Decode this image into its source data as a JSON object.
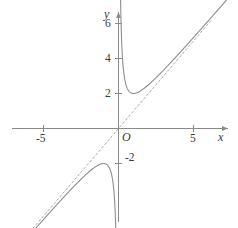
{
  "figure": {
    "width": 238,
    "height": 228,
    "background": "#ffffff",
    "stroke_color": "#8a8a8a",
    "label_color": "#3a3a3a",
    "asymptote_color": "#a8a8a8"
  },
  "axes": {
    "x_label": "x",
    "y_label": "y",
    "origin_label": "O"
  },
  "ticks": {
    "x": [
      {
        "value": -5,
        "label": "-5"
      },
      {
        "value": 5,
        "label": "5"
      }
    ],
    "y": [
      {
        "value": -2,
        "label": "-2"
      },
      {
        "value": 2,
        "label": "2"
      },
      {
        "value": 4,
        "label": "4"
      },
      {
        "value": 6,
        "label": "6"
      }
    ]
  },
  "chart_data": {
    "type": "line",
    "title": "",
    "xlabel": "x",
    "ylabel": "y",
    "xlim": [
      -6.8,
      6.8
    ],
    "ylim": [
      -5.8,
      7.3
    ],
    "grid": false,
    "legend": "none",
    "origin_label": "O",
    "x_ticks": [
      -5,
      5
    ],
    "x_tick_labels": [
      "-5",
      "5"
    ],
    "y_ticks": [
      -2,
      2,
      4,
      6
    ],
    "y_tick_labels": [
      "-2",
      "2",
      "4",
      "6"
    ],
    "series": [
      {
        "name": "y = x + 1/x",
        "style": "solid",
        "color": "#8d8d8d",
        "expression": "x + 1/x",
        "branches": [
          {
            "name": "left-branch",
            "domain": [
              -6.8,
              -0.16
            ],
            "x": [
              -6.8,
              -6.0,
              -5.0,
              -4.0,
              -3.0,
              -2.5,
              -2.0,
              -1.75,
              -1.5,
              -1.25,
              -1.0,
              -0.85,
              -0.7,
              -0.6,
              -0.5,
              -0.42,
              -0.35,
              -0.3,
              -0.25,
              -0.2,
              -0.16
            ],
            "y": [
              -6.947,
              -6.167,
              -5.2,
              -4.25,
              -3.333,
              -2.9,
              -2.5,
              -2.321,
              -2.167,
              -2.05,
              -2.0,
              -2.026,
              -2.129,
              -2.267,
              -2.5,
              -2.801,
              -3.207,
              -3.633,
              -4.25,
              -5.2,
              -6.41
            ]
          },
          {
            "name": "right-branch",
            "domain": [
              0.14,
              6.8
            ],
            "x": [
              0.14,
              0.18,
              0.22,
              0.28,
              0.35,
              0.45,
              0.55,
              0.7,
              0.85,
              1.0,
              1.25,
              1.5,
              2.0,
              2.5,
              3.0,
              4.0,
              5.0,
              6.0,
              6.8
            ],
            "y": [
              7.283,
              5.736,
              4.765,
              3.851,
              3.207,
              2.672,
              2.368,
              2.129,
              2.026,
              2.0,
              2.05,
              2.167,
              2.5,
              2.9,
              3.333,
              4.25,
              5.2,
              6.167,
              6.947
            ]
          }
        ],
        "local_min": {
          "x": 1,
          "y": 2
        },
        "local_max": {
          "x": -1,
          "y": -2
        },
        "vertical_asymptote": 0
      },
      {
        "name": "y = x",
        "style": "dashed",
        "color": "#a8a8a8",
        "expression": "x",
        "x": [
          -6.3,
          6.2
        ],
        "y": [
          -6.3,
          6.2
        ]
      }
    ]
  }
}
